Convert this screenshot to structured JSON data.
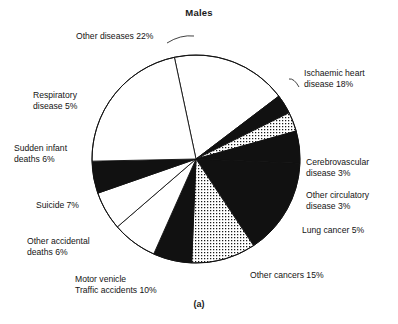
{
  "figure": {
    "title": "Males",
    "caption": "(a)",
    "page_bleed_text": "·  ·   ·    ·     ·      ·       ·        ·         ·          ·"
  },
  "chart_data": {
    "type": "pie",
    "title": "Males",
    "subtitle": "",
    "xlabel": "",
    "ylabel": "",
    "legend_position": "none",
    "grid": false,
    "units": "percent",
    "start_angle_deg": -12,
    "direction": "clockwise",
    "total": 100,
    "categories": [
      "Ischaemic heart disease",
      "Cerebrovascular disease",
      "Other circulatory disease",
      "Lung cancer",
      "Other cancers",
      "Motor venicle Traffic accidents",
      "Other accidental deaths",
      "Suicide",
      "Sudden infant deaths",
      "Respiratory disease",
      "Other diseases"
    ],
    "values": [
      18,
      3,
      3,
      5,
      15,
      10,
      6,
      7,
      6,
      5,
      22
    ],
    "slices": [
      {
        "key": "ischaemic-heart-disease",
        "label": "Ischaemic heart\ndisease 18%",
        "value": 18,
        "fill": "white",
        "color": "#ffffff",
        "label_side": "right",
        "label_left": 304,
        "label_top": 68
      },
      {
        "key": "cerebrovascular-disease",
        "label": "Cerebrovascular\ndisease 3%",
        "value": 3,
        "fill": "black",
        "color": "#111111",
        "label_side": "right",
        "label_left": 306,
        "label_top": 157
      },
      {
        "key": "other-circulatory-disease",
        "label": "Other circulatory\ndisease 3%",
        "value": 3,
        "fill": "stipple",
        "color": "#d8d8d8",
        "label_side": "right",
        "label_left": 306,
        "label_top": 190
      },
      {
        "key": "lung-cancer",
        "label": "Lung cancer 5%",
        "value": 5,
        "fill": "black",
        "color": "#111111",
        "label_side": "right",
        "label_left": 302,
        "label_top": 225
      },
      {
        "key": "other-cancers",
        "label": "Other cancers 15%",
        "value": 15,
        "fill": "black",
        "color": "#111111",
        "label_side": "right",
        "label_left": 250,
        "label_top": 270
      },
      {
        "key": "motor-vehicle-traffic-accidents",
        "label": "Motor venicle\nTraffic accidents 10%",
        "value": 10,
        "fill": "stipple",
        "color": "#d8d8d8",
        "label_side": "bottom",
        "label_left": 75,
        "label_top": 274
      },
      {
        "key": "other-accidental-deaths",
        "label": "Other accidental\ndeaths 6%",
        "value": 6,
        "fill": "black",
        "color": "#111111",
        "label_side": "left",
        "label_left": 27,
        "label_top": 236
      },
      {
        "key": "suicide",
        "label": "Suicide 7%",
        "value": 7,
        "fill": "white",
        "color": "#ffffff",
        "label_side": "left",
        "label_left": 36,
        "label_top": 200
      },
      {
        "key": "sudden-infant-deaths",
        "label": "Sudden infant\ndeaths 6%",
        "value": 6,
        "fill": "white",
        "color": "#ffffff",
        "label_side": "left",
        "label_left": 14,
        "label_top": 143
      },
      {
        "key": "respiratory-disease",
        "label": "Respiratory\ndisease 5%",
        "value": 5,
        "fill": "black",
        "color": "#111111",
        "label_side": "left",
        "label_left": 33,
        "label_top": 90
      },
      {
        "key": "other-diseases",
        "label": "Other diseases 22%",
        "value": 22,
        "fill": "white",
        "color": "#ffffff",
        "label_side": "top",
        "label_left": 76,
        "label_top": 31
      }
    ],
    "geometry": {
      "center_x": 196,
      "center_y": 159,
      "radius": 104
    },
    "style": {
      "outline_color": "#111111",
      "black_fill": "#111111",
      "white_fill": "#ffffff",
      "stipple_dot_color": "#1a1a1a",
      "background": "#ffffff"
    }
  }
}
